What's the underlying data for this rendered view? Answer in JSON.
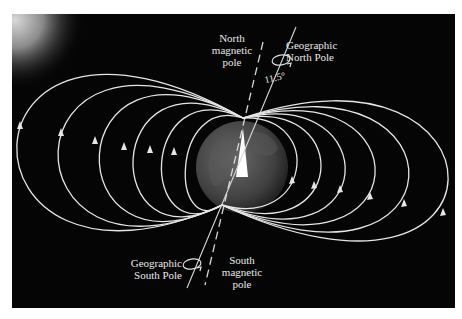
{
  "figure": {
    "labels": {
      "north_magnetic_pole": "North\nmagnetic\npole",
      "geographic_north_pole": "Geographic\nNorth Pole",
      "angle": "11.5°",
      "geographic_south_pole": "Geographic\nSouth Pole",
      "south_magnetic_pole": "South\nmagnetic\npole"
    },
    "colors": {
      "background": "#050505",
      "field_line": "#e6e6e6",
      "earth": "#4a4a4a",
      "frame_border": "#ffffff"
    },
    "field_line_direction": "south-to-north (arrows point up)",
    "left_loop_count": 6,
    "right_loop_count": 6
  }
}
